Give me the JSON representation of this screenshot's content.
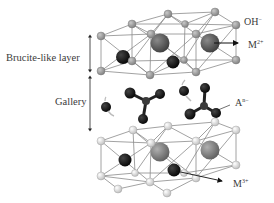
{
  "labels": {
    "brucite_layer": "Brucite-like layer",
    "gallery": "Gallery",
    "hydroxide": {
      "base": "OH",
      "charge": "−"
    },
    "divalent_metal": {
      "base": "M",
      "charge": "2+"
    },
    "interlayer_anion": {
      "base": "A",
      "charge": "n−"
    },
    "trivalent_metal": {
      "base": "M",
      "charge": "3+"
    }
  },
  "colors": {
    "hydroxide_top": "#9a9a9a",
    "hydroxide_bottom": "#d8d8d8",
    "divalent_metal": "#5a5a5a",
    "trivalent_metal": "#111111",
    "bond": "#8a8a8a",
    "anion": "#111111",
    "text": "#3a3a3a"
  },
  "legend_items": [
    "OH−",
    "M2+",
    "An−",
    "M3+"
  ]
}
